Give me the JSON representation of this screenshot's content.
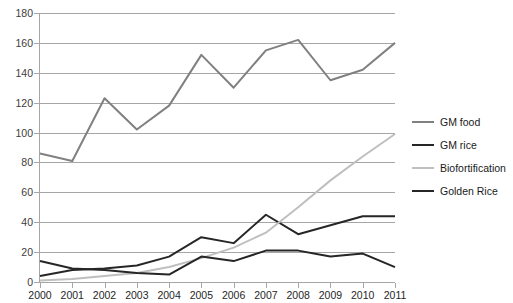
{
  "chart_data": {
    "type": "line",
    "title": "",
    "xlabel": "",
    "ylabel": "",
    "categories": [
      "2000",
      "2001",
      "2002",
      "2003",
      "2004",
      "2005",
      "2006",
      "2007",
      "2008",
      "2009",
      "2010",
      "2011"
    ],
    "ylim": [
      0,
      180
    ],
    "ytick_step": 20,
    "yticks": [
      0,
      20,
      40,
      60,
      80,
      100,
      120,
      140,
      160,
      180
    ],
    "ytick_labels": [
      "0",
      "20",
      "40",
      "60",
      "80",
      "100",
      "120",
      "140",
      "160",
      "180"
    ],
    "grid": true,
    "legend_position": "right",
    "series": [
      {
        "name": "GM food",
        "color": "#808080",
        "values": [
          86,
          81,
          123,
          102,
          118,
          152,
          130,
          155,
          162,
          135,
          142,
          160
        ]
      },
      {
        "name": "GM rice",
        "color": "#262626",
        "values": [
          4,
          8,
          9,
          11,
          17,
          30,
          26,
          45,
          32,
          38,
          44,
          44
        ]
      },
      {
        "name": "Biofortification",
        "color": "#bfbfbf",
        "values": [
          1,
          2,
          4,
          6,
          10,
          16,
          23,
          33,
          50,
          68,
          84,
          99
        ]
      },
      {
        "name": "Golden Rice",
        "color": "#262626",
        "values": [
          14,
          9,
          8,
          6,
          5,
          17,
          14,
          21,
          21,
          17,
          19,
          10
        ]
      }
    ]
  },
  "legend": {
    "items": [
      {
        "label": "GM food",
        "color": "#808080"
      },
      {
        "label": "GM rice",
        "color": "#262626"
      },
      {
        "label": "Biofortification",
        "color": "#bfbfbf"
      },
      {
        "label": "Golden Rice",
        "color": "#262626"
      }
    ]
  },
  "axes": {
    "gridline_color": "#a6a6a6",
    "tick_label_color": "#404040"
  }
}
